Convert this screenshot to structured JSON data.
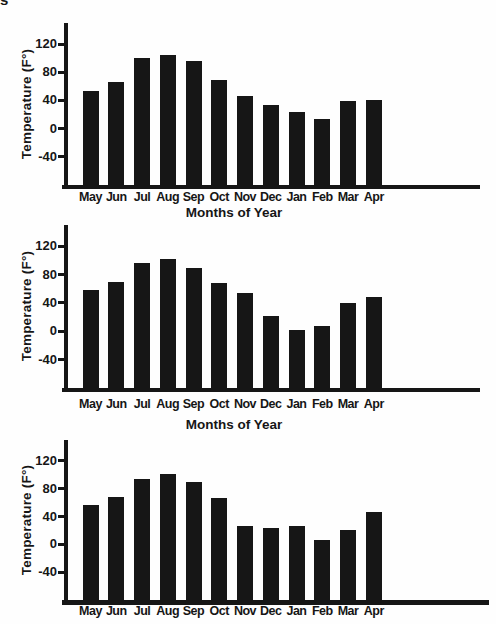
{
  "page": {
    "corner_fragment": "s",
    "background": "#fefefe",
    "ink_color": "#161616"
  },
  "chart_data": [
    {
      "type": "bar",
      "title": "",
      "xlabel": "Months of Year",
      "ylabel": "Temperature (F°)",
      "categories": [
        "May",
        "Jun",
        "Jul",
        "Aug",
        "Sep",
        "Oct",
        "Nov",
        "Dec",
        "Jan",
        "Feb",
        "Mar",
        "Apr"
      ],
      "values": [
        54,
        66,
        100,
        105,
        96,
        69,
        47,
        34,
        24,
        14,
        39,
        41
      ],
      "yticks": [
        120,
        80,
        40,
        0,
        -40
      ],
      "ylim": [
        -80,
        150
      ],
      "bar_color": "#161616",
      "grid": false,
      "legend": "none"
    },
    {
      "type": "bar",
      "title": "",
      "xlabel": "Months of Year",
      "ylabel": "Temperature (F°)",
      "categories": [
        "May",
        "Jun",
        "Jul",
        "Aug",
        "Sep",
        "Oct",
        "Nov",
        "Dec",
        "Jan",
        "Feb",
        "Mar",
        "Apr"
      ],
      "values": [
        58,
        69,
        97,
        102,
        89,
        68,
        54,
        21,
        2,
        7,
        40,
        48
      ],
      "yticks": [
        120,
        80,
        40,
        0,
        -40
      ],
      "ylim": [
        -80,
        150
      ],
      "bar_color": "#161616",
      "grid": false,
      "legend": "none"
    },
    {
      "type": "bar",
      "title": "",
      "ylabel": "Temperature (F°)",
      "categories": [
        "May",
        "Jun",
        "Jul",
        "Aug",
        "Sep",
        "Oct",
        "Nov",
        "Dec",
        "Jan",
        "Feb",
        "Mar",
        "Apr"
      ],
      "values": [
        56,
        68,
        94,
        101,
        89,
        66,
        27,
        23,
        26,
        6,
        20,
        46
      ],
      "yticks": [
        120,
        80,
        40,
        0,
        -40
      ],
      "ylim": [
        -80,
        150
      ],
      "bar_color": "#161616",
      "grid": false,
      "legend": "none"
    }
  ]
}
